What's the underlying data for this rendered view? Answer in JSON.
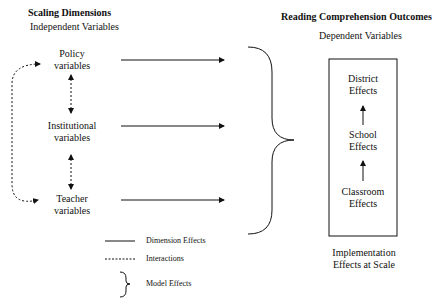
{
  "left_section": {
    "title": "Scaling Dimensions",
    "subtitle": "Independent Variables",
    "nodes": [
      {
        "line1": "Policy",
        "line2": "variables"
      },
      {
        "line1": "Institutional",
        "line2": "variables"
      },
      {
        "line1": "Teacher",
        "line2": "variables"
      }
    ]
  },
  "right_section": {
    "title": "Reading Comprehension Outcomes",
    "subtitle": "Dependent Variables",
    "box_nodes": [
      {
        "line1": "District",
        "line2": "Effects"
      },
      {
        "line1": "School",
        "line2": "Effects"
      },
      {
        "line1": "Classroom",
        "line2": "Effects"
      }
    ],
    "caption_line1": "Implementation",
    "caption_line2": "Effects at Scale"
  },
  "legend": {
    "items": [
      {
        "symbol": "solid-line",
        "label": "Dimension Effects"
      },
      {
        "symbol": "dashed-line",
        "label": "Interactions"
      },
      {
        "symbol": "brace",
        "label": "Model Effects"
      }
    ]
  },
  "colors": {
    "line": "#111111",
    "background": "#ffffff"
  }
}
